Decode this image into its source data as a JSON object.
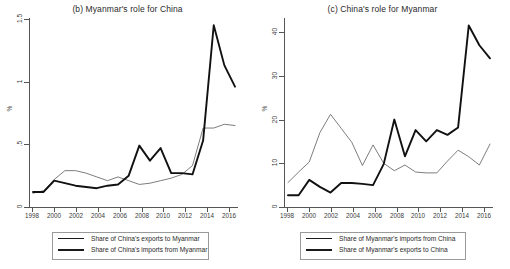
{
  "figure": {
    "background": "#ffffff",
    "line_color_thin": "#6e6e6e",
    "line_color_thick": "#111111"
  },
  "panels": [
    {
      "key": "b",
      "title": "(b) Myanmar's role for China",
      "ylabel": "%"
    },
    {
      "key": "c",
      "title": "(c) China's role for Myanmar",
      "ylabel": "%"
    }
  ],
  "chart_data": [
    {
      "type": "line",
      "title": "(b) Myanmar's role for China",
      "xlabel": "",
      "ylabel": "%",
      "x": [
        1998,
        1999,
        2000,
        2001,
        2002,
        2003,
        2004,
        2005,
        2006,
        2007,
        2008,
        2009,
        2010,
        2011,
        2012,
        2013,
        2014,
        2015,
        2016,
        2017
      ],
      "xlim": [
        1998,
        2017
      ],
      "ylim": [
        0,
        1.5
      ],
      "xticks": [
        1998,
        2000,
        2002,
        2004,
        2006,
        2008,
        2010,
        2012,
        2014,
        2016
      ],
      "yticks": [
        0,
        0.5,
        1,
        1.5
      ],
      "ytick_labels": [
        "0",
        ".5",
        "1",
        "1.5"
      ],
      "grid": false,
      "legend_position": "below-axes",
      "series": [
        {
          "name": "Share of China's exports to Myanmar",
          "style": "thin",
          "values": [
            0.11,
            0.13,
            0.22,
            0.29,
            0.29,
            0.27,
            0.24,
            0.21,
            0.24,
            0.21,
            0.18,
            0.19,
            0.21,
            0.23,
            0.26,
            0.33,
            0.63,
            0.63,
            0.66,
            0.65
          ]
        },
        {
          "name": "Share of China's imports from Myanmar",
          "style": "thick",
          "values": [
            0.12,
            0.12,
            0.21,
            0.19,
            0.17,
            0.16,
            0.15,
            0.17,
            0.18,
            0.25,
            0.49,
            0.37,
            0.47,
            0.27,
            0.27,
            0.26,
            0.53,
            1.45,
            1.13,
            0.96
          ]
        }
      ]
    },
    {
      "type": "line",
      "title": "(c) China's role for Myanmar",
      "xlabel": "",
      "ylabel": "%",
      "x": [
        1998,
        1999,
        2000,
        2001,
        2002,
        2003,
        2004,
        2005,
        2006,
        2007,
        2008,
        2009,
        2010,
        2011,
        2012,
        2013,
        2014,
        2015,
        2016,
        2017
      ],
      "xlim": [
        1998,
        2017
      ],
      "ylim": [
        0,
        43
      ],
      "xticks": [
        1998,
        2000,
        2002,
        2004,
        2006,
        2008,
        2010,
        2012,
        2014,
        2016
      ],
      "yticks": [
        0,
        10,
        20,
        30,
        40
      ],
      "ytick_labels": [
        "0",
        "10",
        "20",
        "30",
        "40"
      ],
      "grid": false,
      "legend_position": "below-axes",
      "series": [
        {
          "name": "Share of Myanmar's imports from China",
          "style": "thin",
          "values": [
            5.6,
            8.0,
            10.3,
            17.0,
            21.2,
            18.0,
            14.8,
            9.5,
            14.2,
            10.0,
            8.3,
            9.6,
            8.0,
            7.8,
            7.8,
            10.5,
            13.0,
            11.5,
            9.6,
            14.4
          ]
        },
        {
          "name": "Share of Myanmar's exports to China",
          "style": "thick",
          "values": [
            2.7,
            2.7,
            6.2,
            4.6,
            3.3,
            5.5,
            5.5,
            5.3,
            5.0,
            9.8,
            20.0,
            11.6,
            17.6,
            15.0,
            17.6,
            16.5,
            18.2,
            41.5,
            37.0,
            34.0
          ]
        }
      ]
    }
  ]
}
